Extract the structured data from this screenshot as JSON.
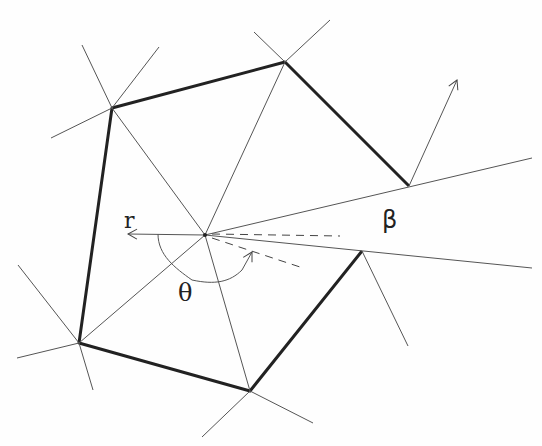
{
  "diagram": {
    "labels": {
      "r": "r",
      "beta": "β",
      "theta": "θ"
    },
    "colors": {
      "edge": "#222222",
      "line": "#555555",
      "background": "#fefefe"
    },
    "center": [
      205,
      235
    ],
    "vertices": [
      [
        112,
        108
      ],
      [
        285,
        62
      ],
      [
        409,
        186
      ],
      [
        362,
        251
      ],
      [
        250,
        391
      ],
      [
        79,
        343
      ]
    ]
  }
}
